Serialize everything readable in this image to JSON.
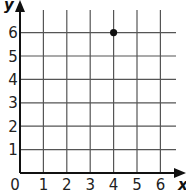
{
  "chart_data": {
    "type": "scatter",
    "title": "",
    "xlabel": "x",
    "ylabel": "y",
    "xlim": [
      0,
      6
    ],
    "ylim": [
      0,
      6
    ],
    "x_ticks": [
      "0",
      "1",
      "2",
      "3",
      "4",
      "5",
      "6"
    ],
    "y_ticks": [
      "1",
      "2",
      "3",
      "4",
      "5",
      "6"
    ],
    "grid": true,
    "legend": null,
    "series": [
      {
        "name": "point",
        "x": [
          4
        ],
        "y": [
          6
        ]
      }
    ],
    "colors": {
      "grid": "#555555",
      "axis": "#111111",
      "point": "#111111"
    }
  }
}
